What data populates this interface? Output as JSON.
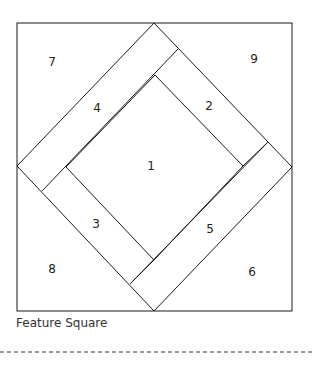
{
  "diagram": {
    "title": "Feature Square",
    "stroke_color": "#1a1a1a",
    "pieces": [
      {
        "id": "1",
        "label": "1",
        "x": 151,
        "y": 170
      },
      {
        "id": "2",
        "label": "2",
        "x": 209,
        "y": 110
      },
      {
        "id": "3",
        "label": "3",
        "x": 96,
        "y": 228
      },
      {
        "id": "4",
        "label": "4",
        "x": 97,
        "y": 112
      },
      {
        "id": "5",
        "label": "5",
        "x": 210,
        "y": 233
      },
      {
        "id": "6",
        "label": "6",
        "x": 252,
        "y": 276
      },
      {
        "id": "7",
        "label": "7",
        "x": 52,
        "y": 66
      },
      {
        "id": "8",
        "label": "8",
        "x": 52,
        "y": 273
      },
      {
        "id": "9",
        "label": "9",
        "x": 254,
        "y": 63
      }
    ]
  }
}
